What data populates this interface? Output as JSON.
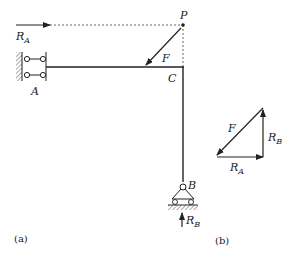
{
  "figure": {
    "panel_a": {
      "caption": "(a)",
      "labels": {
        "RA": {
          "main": "R",
          "sub": "A"
        },
        "A": "A",
        "P": "P",
        "F": "F",
        "C": "C",
        "B": "B",
        "RB": {
          "main": "R",
          "sub": "B"
        }
      }
    },
    "panel_b": {
      "caption": "(b)",
      "labels": {
        "F": "F",
        "RA": {
          "main": "R",
          "sub": "A"
        },
        "RB": {
          "main": "R",
          "sub": "B"
        }
      }
    },
    "colors": {
      "line": "#222222",
      "dashed": "#444444"
    }
  }
}
